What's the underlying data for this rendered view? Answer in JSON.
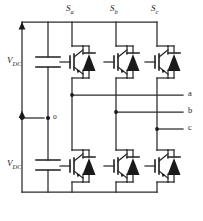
{
  "figure": {
    "type": "circuit-schematic",
    "width": 203,
    "height": 221,
    "line_color": "#2b2b2b",
    "fill_color": "#1a1a1a",
    "background": "#ffffff"
  },
  "switch_labels": [
    {
      "name": "S",
      "sub": "a",
      "x": 66,
      "y": 4
    },
    {
      "name": "S",
      "sub": "b",
      "x": 110,
      "y": 4
    },
    {
      "name": "S",
      "sub": "c",
      "x": 151,
      "y": 4
    }
  ],
  "source_labels": [
    {
      "name": "V",
      "sub": "DC",
      "x": 9,
      "y": 57
    },
    {
      "name": "V",
      "sub": "DC",
      "x": 9,
      "y": 166
    }
  ],
  "node_labels": [
    {
      "text": "o",
      "x": 48,
      "y": 112
    }
  ],
  "phase_labels": [
    {
      "text": "a",
      "x": 188,
      "y": 91
    },
    {
      "text": "b",
      "x": 188,
      "y": 108
    },
    {
      "text": "c",
      "x": 188,
      "y": 125
    }
  ],
  "geometry": {
    "rail_top_y": 22,
    "rail_bottom_y": 192,
    "left_rail_x": 22,
    "cap_rail_x": 48,
    "leg_x": [
      72,
      116,
      157
    ],
    "phase_line_right_x": 183,
    "phase_line_y": [
      95,
      112,
      129
    ],
    "cap_upper_plates_y": [
      57,
      67
    ],
    "cap_lower_plates_y": [
      160,
      170
    ],
    "neutral_y": 118,
    "igbt_upper_center_y": 62,
    "igbt_lower_center_y": 166
  },
  "components": {
    "capacitor_count": 2,
    "igbt_count": 6,
    "diode_count": 6,
    "phase_output_count": 3
  }
}
